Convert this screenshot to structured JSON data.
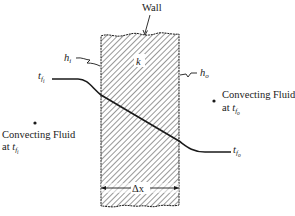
{
  "figure": {
    "type": "plane wall with convection on both sides",
    "wall_label": "Wall",
    "conductivity_label": "k",
    "inner_coefficient": {
      "symbol": "h",
      "subscript": "i"
    },
    "outer_coefficient": {
      "symbol": "h",
      "subscript": "o"
    },
    "inner_fluid_temp": {
      "symbol": "t",
      "subscript": "f",
      "subsubscript": "i"
    },
    "outer_fluid_temp": {
      "symbol": "t",
      "subscript": "f",
      "subsubscript": "o"
    },
    "thickness_label": "Δx",
    "left_fluid": {
      "line1": "Convecting Fluid",
      "line2_prefix": "at ",
      "temp_symbol": "t",
      "temp_sub": "f",
      "temp_subsub": "i"
    },
    "right_fluid": {
      "line1": "Convecting Fluid",
      "line2_prefix": "at ",
      "temp_symbol": "t",
      "temp_sub": "f",
      "temp_subsub": "o"
    }
  },
  "colors": {
    "ink": "#1a1a1a",
    "background": "#ffffff"
  }
}
